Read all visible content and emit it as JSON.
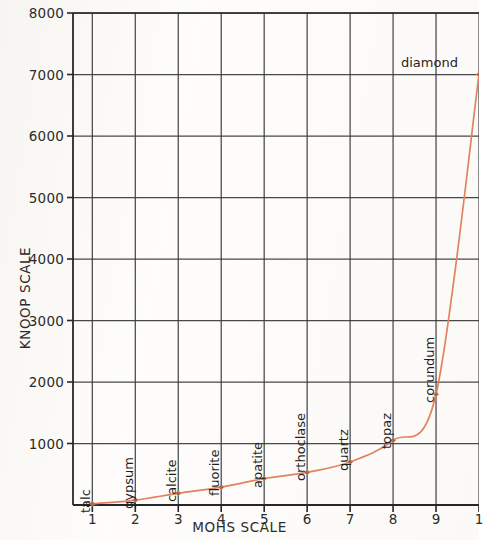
{
  "chart_data": {
    "type": "line",
    "title": "",
    "xlabel": "MOHS SCALE",
    "ylabel": "KNOOP SCALE",
    "xlim": [
      0.55,
      10.0
    ],
    "ylim": [
      0,
      8000
    ],
    "grid": true,
    "legend": "none",
    "marker": "diamond",
    "line_color": "#e2825e",
    "x": [
      1,
      2,
      3,
      4,
      5,
      6,
      7,
      8,
      9,
      10
    ],
    "values": [
      20,
      80,
      190,
      290,
      430,
      530,
      700,
      1050,
      1800,
      7000
    ],
    "categories": [
      "talc",
      "gypsum",
      "calcite",
      "fluorite",
      "apatite",
      "orthoclase",
      "quartz",
      "topaz",
      "corundum",
      "diamond"
    ],
    "point_labels": [
      {
        "name": "talc",
        "mohs": 1,
        "knoop": 20,
        "orientation": "vertical"
      },
      {
        "name": "gypsum",
        "mohs": 2,
        "knoop": 80,
        "orientation": "vertical"
      },
      {
        "name": "calcite",
        "mohs": 3,
        "knoop": 190,
        "orientation": "vertical"
      },
      {
        "name": "fluorite",
        "mohs": 4,
        "knoop": 290,
        "orientation": "vertical"
      },
      {
        "name": "apatite",
        "mohs": 5,
        "knoop": 430,
        "orientation": "vertical"
      },
      {
        "name": "orthoclase",
        "mohs": 6,
        "knoop": 530,
        "orientation": "vertical"
      },
      {
        "name": "quartz",
        "mohs": 7,
        "knoop": 700,
        "orientation": "vertical"
      },
      {
        "name": "topaz",
        "mohs": 8,
        "knoop": 1050,
        "orientation": "vertical"
      },
      {
        "name": "corundum",
        "mohs": 9,
        "knoop": 1800,
        "orientation": "vertical"
      },
      {
        "name": "diamond",
        "mohs": 10,
        "knoop": 7000,
        "orientation": "horizontal"
      }
    ],
    "y_ticks": [
      1000,
      2000,
      3000,
      4000,
      5000,
      6000,
      7000,
      8000
    ],
    "y_tick_labels": [
      "1000",
      "2000",
      "3000",
      "4000",
      "5000",
      "6000",
      "7000",
      "8000"
    ],
    "x_ticks": [
      1,
      2,
      3,
      4,
      5,
      6,
      7,
      8,
      9,
      10
    ],
    "x_tick_labels": [
      "1",
      "2",
      "3",
      "4",
      "5",
      "6",
      "7",
      "8",
      "9",
      "1"
    ]
  },
  "axes": {
    "x_title": "MOHS SCALE",
    "y_title": "KNOOP SCALE"
  },
  "colors": {
    "curve": "#e2825e",
    "grid": "#3a3a3a",
    "axis": "#272727",
    "text": "#222222",
    "background": "#fdfcfa"
  }
}
